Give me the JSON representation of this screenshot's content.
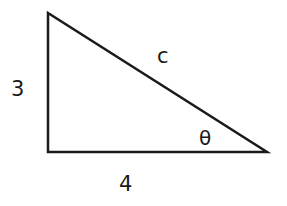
{
  "diagram": {
    "type": "right-triangle",
    "vertices": {
      "top": [
        48,
        13
      ],
      "right_angle": [
        48,
        152
      ],
      "acute": [
        267,
        152
      ]
    },
    "labels": {
      "vertical_side": "3",
      "horizontal_side": "4",
      "hypotenuse": "c",
      "angle": "θ"
    },
    "stroke_color": "#1a1a1a",
    "background": "#ffffff"
  }
}
